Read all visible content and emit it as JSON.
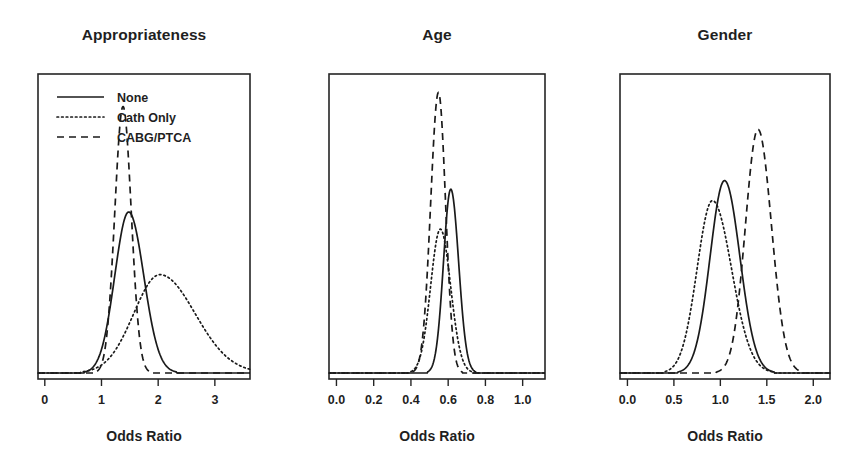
{
  "figure": {
    "background": "#ffffff",
    "ink_color": "#1a1a1a",
    "axis_label": "Odds Ratio"
  },
  "legend": {
    "entries": [
      {
        "label": "None",
        "style": "solid",
        "key": "none"
      },
      {
        "label": "Cath Only",
        "style": "dotted",
        "key": "cath"
      },
      {
        "label": "CABG/PTCA",
        "style": "dashed",
        "key": "cabg"
      }
    ]
  },
  "chart_data": [
    {
      "type": "line",
      "title": "Appropriateness",
      "xlabel": "Odds Ratio",
      "ylabel": "",
      "xlim": [
        -0.12,
        3.62
      ],
      "ylim": [
        0,
        1.0
      ],
      "ticks": [
        {
          "value": 0,
          "label": "0"
        },
        {
          "value": 1,
          "label": "1"
        },
        {
          "value": 2,
          "label": "2"
        },
        {
          "value": 3,
          "label": "3"
        }
      ],
      "grid": false,
      "legend_position": "top-left",
      "series": [
        {
          "name": "None",
          "style": "solid",
          "peak_x": 1.48,
          "peak_y": 0.565,
          "sigma_left": 0.245,
          "sigma_right": 0.265
        },
        {
          "name": "Cath Only",
          "style": "dotted",
          "peak_x": 2.03,
          "peak_y": 0.345,
          "sigma_left": 0.46,
          "sigma_right": 0.62
        },
        {
          "name": "CABG/PTCA",
          "style": "dashed",
          "peak_x": 1.38,
          "peak_y": 0.935,
          "sigma_left": 0.145,
          "sigma_right": 0.145
        }
      ]
    },
    {
      "type": "line",
      "title": "Age",
      "xlabel": "Odds Ratio",
      "ylabel": "",
      "xlim": [
        -0.04,
        1.12
      ],
      "ylim": [
        0,
        1.0
      ],
      "ticks": [
        {
          "value": 0.0,
          "label": "0.0"
        },
        {
          "value": 0.2,
          "label": "0.2"
        },
        {
          "value": 0.4,
          "label": "0.4"
        },
        {
          "value": 0.6,
          "label": "0.6"
        },
        {
          "value": 0.8,
          "label": "0.8"
        },
        {
          "value": 1.0,
          "label": "1.0"
        }
      ],
      "grid": false,
      "legend_position": "none",
      "series": [
        {
          "name": "None",
          "style": "solid",
          "peak_x": 0.614,
          "peak_y": 0.645,
          "sigma_left": 0.039,
          "sigma_right": 0.042
        },
        {
          "name": "Cath Only",
          "style": "dotted",
          "peak_x": 0.558,
          "peak_y": 0.505,
          "sigma_left": 0.052,
          "sigma_right": 0.055
        },
        {
          "name": "CABG/PTCA",
          "style": "dashed",
          "peak_x": 0.548,
          "peak_y": 0.985,
          "sigma_left": 0.042,
          "sigma_right": 0.038
        }
      ]
    },
    {
      "type": "line",
      "title": "Gender",
      "xlabel": "Odds Ratio",
      "ylabel": "",
      "xlim": [
        -0.08,
        2.18
      ],
      "ylim": [
        0,
        1.0
      ],
      "ticks": [
        {
          "value": 0.0,
          "label": "0.0"
        },
        {
          "value": 0.5,
          "label": "0.5"
        },
        {
          "value": 1.0,
          "label": "1.0"
        },
        {
          "value": 1.5,
          "label": "1.5"
        },
        {
          "value": 2.0,
          "label": "2.0"
        }
      ],
      "grid": false,
      "legend_position": "none",
      "series": [
        {
          "name": "None",
          "style": "solid",
          "peak_x": 1.045,
          "peak_y": 0.675,
          "sigma_left": 0.155,
          "sigma_right": 0.165
        },
        {
          "name": "Cath Only",
          "style": "dotted",
          "peak_x": 0.915,
          "peak_y": 0.605,
          "sigma_left": 0.165,
          "sigma_right": 0.205
        },
        {
          "name": "CABG/PTCA",
          "style": "dashed",
          "peak_x": 1.405,
          "peak_y": 0.855,
          "sigma_left": 0.135,
          "sigma_right": 0.145
        }
      ]
    }
  ],
  "panel_geometry": [
    {
      "x": 38,
      "y": 74,
      "width": 212,
      "height": 305
    },
    {
      "x": 329,
      "y": 74,
      "width": 216,
      "height": 305
    },
    {
      "x": 620,
      "y": 74,
      "width": 210,
      "height": 305
    }
  ],
  "layout": {
    "title_y": 40,
    "tick_label_y": 404,
    "axis_label_y": 441,
    "tick_length": 7,
    "baseline_offset": 6
  }
}
